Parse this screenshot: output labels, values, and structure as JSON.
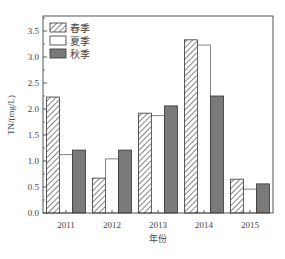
{
  "chart_data": {
    "type": "bar",
    "title": "",
    "xlabel": "年份",
    "ylabel": "TN/(mg/L)",
    "categories": [
      "2011",
      "2012",
      "2013",
      "2014",
      "2015"
    ],
    "series": [
      {
        "name": "春季",
        "pattern": "hatched",
        "values": [
          2.23,
          0.67,
          1.92,
          3.33,
          0.65
        ]
      },
      {
        "name": "夏季",
        "pattern": "white",
        "values": [
          1.12,
          1.04,
          1.87,
          3.23,
          0.46
        ]
      },
      {
        "name": "秋季",
        "pattern": "gray",
        "values": [
          1.21,
          1.21,
          2.06,
          2.25,
          0.56
        ]
      }
    ],
    "ylim": [
      0,
      3.75
    ],
    "yticks": [
      "0.0",
      "0.5",
      "1.0",
      "1.5",
      "2.0",
      "2.5",
      "3.0",
      "3.5"
    ],
    "grid": false,
    "legend_position": "upper-left"
  },
  "colors": {
    "gray_fill": "#7a7a7a",
    "stroke": "#333333"
  }
}
